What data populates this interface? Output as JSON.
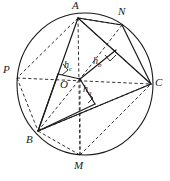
{
  "figure": {
    "type": "geometry-diagram",
    "canvas": {
      "width": 170,
      "height": 181
    },
    "stroke_color": "#1a1a1a",
    "background_color": "#ffffff",
    "circle": {
      "cx": 85,
      "cy": 84,
      "r": 70
    },
    "center_point": {
      "name": "O",
      "x": 80,
      "y": 79
    },
    "vertices": [
      {
        "name": "A",
        "x": 78,
        "y": 18,
        "label_x": 72,
        "label_y": 1
      },
      {
        "name": "N",
        "x": 122,
        "y": 25,
        "label_x": 119,
        "label_y": 7
      },
      {
        "name": "C",
        "x": 152,
        "y": 84,
        "label_x": 155,
        "label_y": 78
      },
      {
        "name": "M",
        "x": 80,
        "y": 155,
        "label_x": 75,
        "label_y": 159
      },
      {
        "name": "B",
        "x": 38,
        "y": 131,
        "label_x": 27,
        "label_y": 134
      },
      {
        "name": "P",
        "x": 17,
        "y": 77,
        "label_x": 4,
        "label_y": 66
      }
    ],
    "altitude_labels": [
      {
        "name": "h_a",
        "base": "h",
        "sub": "a",
        "x": 84,
        "y": 85
      },
      {
        "name": "h_b",
        "base": "h",
        "sub": "b",
        "x": 94,
        "y": 57
      },
      {
        "name": "h_c",
        "base": "h",
        "sub": "c",
        "x": 65,
        "y": 61
      }
    ],
    "center_label": {
      "text": "O",
      "x": 61,
      "y": 80
    },
    "solid_segments": [
      {
        "name": "side-AB",
        "x1": 78,
        "y1": 18,
        "x2": 38,
        "y2": 131
      },
      {
        "name": "side-BC",
        "x1": 38,
        "y1": 131,
        "x2": 152,
        "y2": 84
      },
      {
        "name": "side-CA",
        "x1": 152,
        "y1": 84,
        "x2": 78,
        "y2": 18
      },
      {
        "name": "radius-OA-to-N",
        "x1": 78,
        "y1": 18,
        "x2": 122,
        "y2": 25
      },
      {
        "name": "chord-N-to-C",
        "x1": 122,
        "y1": 25,
        "x2": 152,
        "y2": 84
      },
      {
        "name": "perp-ha",
        "x1": 80,
        "y1": 79,
        "x2": 95,
        "y2": 104
      },
      {
        "name": "perp-hb",
        "x1": 80,
        "y1": 79,
        "x2": 115,
        "y2": 51
      },
      {
        "name": "perp-hc",
        "x1": 80,
        "y1": 79,
        "x2": 58,
        "y2": 75
      },
      {
        "name": "foot-hc-to-B",
        "x1": 58,
        "y1": 75,
        "x2": 38,
        "y2": 131
      },
      {
        "name": "foot-ha-to-B",
        "x1": 95,
        "y1": 104,
        "x2": 38,
        "y2": 131
      }
    ],
    "dashed_segments": [
      {
        "name": "chord-A-to-M",
        "x1": 78,
        "y1": 18,
        "x2": 80,
        "y2": 155
      },
      {
        "name": "chord-O-to-P",
        "x1": 17,
        "y1": 77,
        "x2": 152,
        "y2": 84
      },
      {
        "name": "chord-A-to-P",
        "x1": 78,
        "y1": 18,
        "x2": 17,
        "y2": 77
      },
      {
        "name": "chord-A-to-N-arc",
        "x1": 78,
        "y1": 18,
        "x2": 122,
        "y2": 25
      },
      {
        "name": "chord-A-to-C",
        "x1": 78,
        "y1": 18,
        "x2": 152,
        "y2": 84
      },
      {
        "name": "chord-P-to-B",
        "x1": 17,
        "y1": 77,
        "x2": 38,
        "y2": 131
      },
      {
        "name": "chord-B-to-M",
        "x1": 38,
        "y1": 131,
        "x2": 80,
        "y2": 155
      },
      {
        "name": "chord-B-to-C",
        "x1": 38,
        "y1": 131,
        "x2": 152,
        "y2": 84
      },
      {
        "name": "chord-M-to-C",
        "x1": 80,
        "y1": 155,
        "x2": 152,
        "y2": 84
      },
      {
        "name": "chord-N-to-O",
        "x1": 122,
        "y1": 25,
        "x2": 80,
        "y2": 79
      },
      {
        "name": "chord-B-to-O",
        "x1": 38,
        "y1": 131,
        "x2": 80,
        "y2": 79
      }
    ],
    "right_angle_marks": [
      {
        "name": "right-angle-hc",
        "x": 62,
        "y": 69
      },
      {
        "name": "right-angle-ha",
        "x": 90,
        "y": 96
      },
      {
        "name": "right-angle-hb",
        "x": 109,
        "y": 57
      }
    ]
  }
}
